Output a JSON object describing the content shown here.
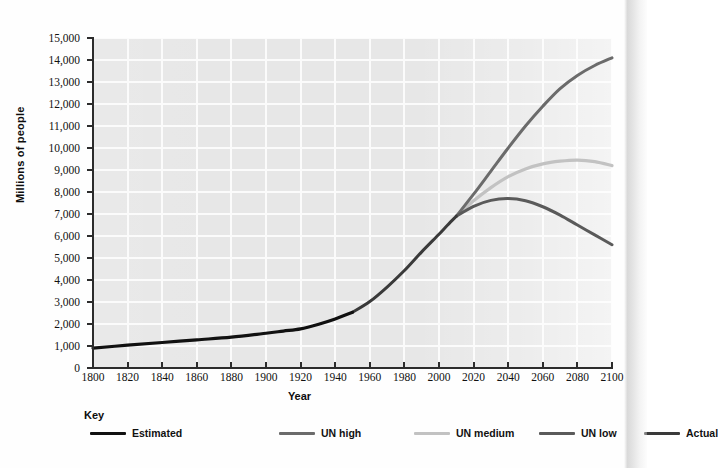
{
  "chart_data": {
    "type": "line",
    "title": "",
    "xlabel": "Year",
    "ylabel": "Millions of people",
    "xlim": [
      1800,
      2100
    ],
    "ylim": [
      0,
      15000
    ],
    "grid": true,
    "legend_position": "bottom",
    "legend_title": "Key",
    "x_ticks": [
      1800,
      1820,
      1840,
      1860,
      1880,
      1900,
      1920,
      1940,
      1960,
      1980,
      2000,
      2020,
      2040,
      2060,
      2080,
      2100
    ],
    "y_ticks": [
      0,
      1000,
      2000,
      3000,
      4000,
      5000,
      6000,
      7000,
      8000,
      9000,
      10000,
      11000,
      12000,
      13000,
      14000,
      15000
    ],
    "y_tick_labels": [
      "0",
      "1,000",
      "2,000",
      "3,000",
      "4,000",
      "5,000",
      "6,000",
      "7,000",
      "8,000",
      "9,000",
      "10,000",
      "11,000",
      "12,000",
      "13,000",
      "14,000",
      "15,000"
    ],
    "x_tick_labels": [
      "1800",
      "1820",
      "1840",
      "1860",
      "1880",
      "1900",
      "1920",
      "1940",
      "1960",
      "1980",
      "2000",
      "2020",
      "2040",
      "2060",
      "2080",
      "2100"
    ],
    "series": [
      {
        "name": "Estimated",
        "color": "#111111",
        "width": 3.2,
        "x": [
          1800,
          1820,
          1840,
          1860,
          1880,
          1900,
          1910,
          1920,
          1930,
          1940,
          1950
        ],
        "values": [
          900,
          1040,
          1160,
          1280,
          1400,
          1580,
          1680,
          1780,
          1980,
          2230,
          2530
        ]
      },
      {
        "name": "Actual",
        "color": "#3a3a3a",
        "width": 3.0,
        "x": [
          1950,
          1960,
          1970,
          1980,
          1990,
          2000,
          2005,
          2010
        ],
        "values": [
          2530,
          3020,
          3680,
          4430,
          5280,
          6080,
          6500,
          6900
        ]
      },
      {
        "name": "UN high",
        "color": "#6b6b6b",
        "width": 3.0,
        "x": [
          2010,
          2020,
          2030,
          2040,
          2050,
          2060,
          2070,
          2080,
          2090,
          2100
        ],
        "values": [
          6900,
          7900,
          8950,
          10000,
          11000,
          11900,
          12700,
          13300,
          13750,
          14100
        ]
      },
      {
        "name": "UN medium",
        "color": "#c2c2c2",
        "width": 3.2,
        "x": [
          2010,
          2020,
          2030,
          2040,
          2050,
          2060,
          2070,
          2080,
          2090,
          2100
        ],
        "values": [
          6900,
          7600,
          8200,
          8700,
          9050,
          9280,
          9400,
          9450,
          9380,
          9200
        ]
      },
      {
        "name": "UN low",
        "color": "#5a5a5a",
        "width": 3.0,
        "x": [
          2010,
          2020,
          2030,
          2040,
          2050,
          2060,
          2070,
          2080,
          2090,
          2100
        ],
        "values": [
          6900,
          7350,
          7620,
          7700,
          7600,
          7330,
          6950,
          6500,
          6050,
          5600
        ]
      }
    ]
  },
  "axis": {
    "y_title": "Millions of people",
    "x_title": "Year"
  },
  "key": {
    "title": "Key",
    "items": [
      {
        "label": "Estimated",
        "color": "#111111"
      },
      {
        "label": "UN high",
        "color": "#6b6b6b"
      },
      {
        "label": "UN medium",
        "color": "#c2c2c2"
      },
      {
        "label": "UN low",
        "color": "#5a5a5a"
      },
      {
        "label": "Actual",
        "color": "#3a3a3a"
      }
    ]
  }
}
